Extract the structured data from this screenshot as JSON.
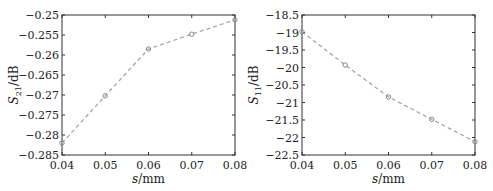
{
  "chart_data": [
    {
      "type": "line",
      "title": "",
      "xlabel": "s/mm",
      "ylabel": "S21/dB",
      "ylabel_main": "S",
      "ylabel_sub": "21",
      "ylabel_unit": "/dB",
      "x": [
        0.04,
        0.05,
        0.06,
        0.07,
        0.08
      ],
      "series": [
        {
          "name": "S21",
          "values": [
            -0.282,
            -0.2702,
            -0.2585,
            -0.2548,
            -0.2512
          ]
        }
      ],
      "xlim": [
        0.04,
        0.08
      ],
      "ylim": [
        -0.285,
        -0.25
      ],
      "xticks": [
        "0.04",
        "0.05",
        "0.06",
        "0.07",
        "0.08"
      ],
      "yticks": [
        "-0.25",
        "-0.255",
        "-0.26",
        "-0.265",
        "-0.27",
        "-0.275",
        "-0.28",
        "-0.285"
      ],
      "line_style": "dashed",
      "marker": "circle",
      "grid": false,
      "legend": false
    },
    {
      "type": "line",
      "title": "",
      "xlabel": "s/mm",
      "ylabel": "S11/dB",
      "ylabel_main": "S",
      "ylabel_sub": "11",
      "ylabel_unit": "/dB",
      "x": [
        0.04,
        0.05,
        0.06,
        0.07,
        0.08
      ],
      "series": [
        {
          "name": "S11",
          "values": [
            -18.98,
            -19.93,
            -20.84,
            -21.48,
            -22.12
          ]
        }
      ],
      "xlim": [
        0.04,
        0.08
      ],
      "ylim": [
        -22.5,
        -18.5
      ],
      "xticks": [
        "0.04",
        "0.05",
        "0.06",
        "0.07",
        "0.08"
      ],
      "yticks": [
        "-18.5",
        "-19",
        "-19.5",
        "-20",
        "-20.5",
        "-21",
        "-21.5",
        "-22",
        "-22.5"
      ],
      "line_style": "dashed",
      "marker": "circle",
      "grid": false,
      "legend": false
    }
  ],
  "colors": {
    "axis": "#333333",
    "line": "#a8a8a8",
    "marker": "#888888"
  }
}
